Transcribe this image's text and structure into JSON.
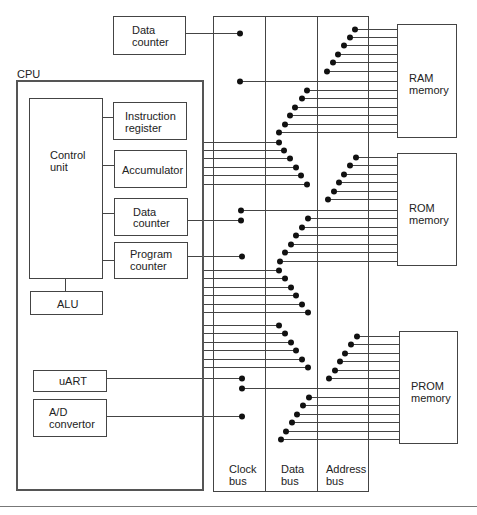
{
  "diagram": {
    "cpu": {
      "label": "CPU",
      "control_unit": {
        "line1": "Control",
        "line2": "unit"
      },
      "instruction_register": {
        "line1": "Instruction",
        "line2": "register"
      },
      "accumulator": {
        "line1": "Accumulator"
      },
      "data_counter": {
        "line1": "Data",
        "line2": "counter"
      },
      "program_counter": {
        "line1": "Program",
        "line2": "counter"
      },
      "alu": {
        "line1": "ALU"
      },
      "uart": {
        "line1": "uART"
      },
      "ad_convertor": {
        "line1": "A/D",
        "line2": "convertor"
      }
    },
    "external_data_counter": {
      "line1": "Data",
      "line2": "counter"
    },
    "memories": {
      "ram": {
        "line1": "RAM",
        "line2": "memory"
      },
      "rom": {
        "line1": "ROM",
        "line2": "memory"
      },
      "prom": {
        "line1": "PROM",
        "line2": "memory"
      }
    },
    "buses": [
      {
        "line1": "Clock",
        "line2": "bus"
      },
      {
        "line1": "Data",
        "line2": "bus"
      },
      {
        "line1": "Address",
        "line2": "bus"
      }
    ],
    "colors": {
      "line": "#444444",
      "dot": "#111111",
      "background": "#ffffff"
    }
  }
}
